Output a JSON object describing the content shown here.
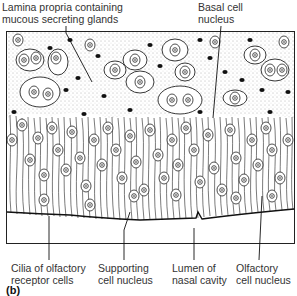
{
  "figure": {
    "panel_letter": "(b)",
    "labels_top": [
      {
        "line1": "Lamina propria containing",
        "line2": "mucous secreting glands"
      },
      {
        "line1": "Basal cell",
        "line2": "nucleus"
      }
    ],
    "labels_bottom": [
      {
        "line1": "Cilia of olfactory",
        "line2": "receptor cells"
      },
      {
        "line1": "Supporting",
        "line2": "cell nucleus"
      },
      {
        "line1": "Lumen of",
        "line2": "nasal cavity"
      },
      {
        "line1": "Olfactory",
        "line2": "cell nucleus"
      }
    ],
    "colors": {
      "ink": "#1a1a1a",
      "stipple": "#555555",
      "background": "#ffffff"
    }
  }
}
